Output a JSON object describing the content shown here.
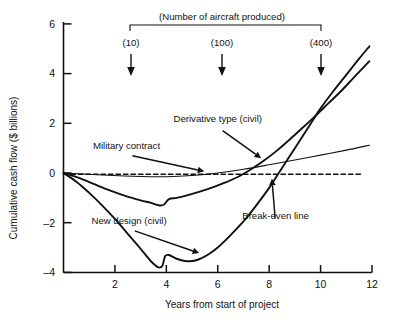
{
  "chart_data": {
    "type": "line",
    "title": "",
    "xlabel": "Years from start of project",
    "ylabel": "Cumulative cash flow ($ billions)",
    "xlim": [
      0,
      12
    ],
    "ylim": [
      -4,
      6
    ],
    "xticks": [
      2,
      4,
      6,
      8,
      10,
      12
    ],
    "yticks": [
      -4,
      -2,
      0,
      2,
      4,
      6
    ],
    "grid": false,
    "legend": "none (inline annotations)",
    "header_note": "(Number of aircraft produced)",
    "production_markers": [
      {
        "label": "(10)",
        "year": 3.0
      },
      {
        "label": "(100)",
        "year": 6.4
      },
      {
        "label": "(400)",
        "year": 10.2
      }
    ],
    "series": [
      {
        "name": "New design (civil)",
        "style": "solid-thick",
        "points": [
          [
            0.0,
            0.0
          ],
          [
            0.5,
            -0.35
          ],
          [
            1.0,
            -0.8
          ],
          [
            1.5,
            -1.3
          ],
          [
            2.0,
            -1.85
          ],
          [
            2.5,
            -2.45
          ],
          [
            3.0,
            -3.05
          ],
          [
            3.4,
            -3.55
          ],
          [
            3.7,
            -3.8
          ],
          [
            3.85,
            -3.72
          ],
          [
            3.95,
            -3.35
          ],
          [
            4.1,
            -3.3
          ],
          [
            4.4,
            -3.45
          ],
          [
            4.8,
            -3.55
          ],
          [
            5.2,
            -3.5
          ],
          [
            5.6,
            -3.3
          ],
          [
            6.0,
            -3.0
          ],
          [
            6.5,
            -2.5
          ],
          [
            7.0,
            -1.95
          ],
          [
            7.5,
            -1.3
          ],
          [
            8.0,
            -0.6
          ],
          [
            8.5,
            0.2
          ],
          [
            9.0,
            1.0
          ],
          [
            9.5,
            1.8
          ],
          [
            10.0,
            2.6
          ],
          [
            10.5,
            3.3
          ],
          [
            11.0,
            3.95
          ],
          [
            11.5,
            4.6
          ],
          [
            11.9,
            5.1
          ]
        ]
      },
      {
        "name": "Derivative type (civil)",
        "style": "solid-thick",
        "points": [
          [
            0.0,
            0.0
          ],
          [
            0.6,
            -0.2
          ],
          [
            1.2,
            -0.45
          ],
          [
            1.8,
            -0.7
          ],
          [
            2.4,
            -0.92
          ],
          [
            3.0,
            -1.1
          ],
          [
            3.4,
            -1.2
          ],
          [
            3.7,
            -1.3
          ],
          [
            3.9,
            -1.28
          ],
          [
            4.1,
            -1.05
          ],
          [
            4.4,
            -1.0
          ],
          [
            4.8,
            -0.9
          ],
          [
            5.3,
            -0.75
          ],
          [
            5.8,
            -0.58
          ],
          [
            6.3,
            -0.38
          ],
          [
            6.8,
            -0.15
          ],
          [
            7.3,
            0.15
          ],
          [
            7.8,
            0.5
          ],
          [
            8.3,
            0.9
          ],
          [
            8.8,
            1.35
          ],
          [
            9.3,
            1.82
          ],
          [
            9.8,
            2.3
          ],
          [
            10.3,
            2.8
          ],
          [
            10.8,
            3.3
          ],
          [
            11.3,
            3.85
          ],
          [
            11.9,
            4.5
          ]
        ]
      },
      {
        "name": "Military contract",
        "style": "solid-thin",
        "points": [
          [
            0.0,
            0.0
          ],
          [
            1.5,
            -0.08
          ],
          [
            3.0,
            -0.14
          ],
          [
            4.0,
            -0.15
          ],
          [
            5.0,
            -0.1
          ],
          [
            6.0,
            0.0
          ],
          [
            7.0,
            0.15
          ],
          [
            8.0,
            0.33
          ],
          [
            9.0,
            0.52
          ],
          [
            10.0,
            0.72
          ],
          [
            11.0,
            0.92
          ],
          [
            11.9,
            1.12
          ]
        ]
      },
      {
        "name": "Break-even line",
        "style": "dashed",
        "points": [
          [
            0.0,
            -0.05
          ],
          [
            11.6,
            -0.05
          ]
        ]
      }
    ],
    "annotations": [
      {
        "text": "Derivative type (civil)",
        "label_x": 6.0,
        "label_y": 2.05,
        "arrow_to_x": 7.75,
        "arrow_to_y": 0.55
      },
      {
        "text": "Military contract",
        "label_x": 2.45,
        "label_y": 0.95,
        "arrow_to_x": 5.55,
        "arrow_to_y": 0.05
      },
      {
        "text": "New design (civil)",
        "label_x": 2.55,
        "label_y": -2.05,
        "arrow_to_x": 5.35,
        "arrow_to_y": -3.25
      },
      {
        "text": "Break-even line",
        "label_x": 8.25,
        "label_y": -1.85,
        "arrow_to_x": 8.1,
        "arrow_to_y": -0.15
      }
    ]
  },
  "colors": {
    "axis": "#111111",
    "curve": "#111111",
    "background": "#ffffff"
  }
}
